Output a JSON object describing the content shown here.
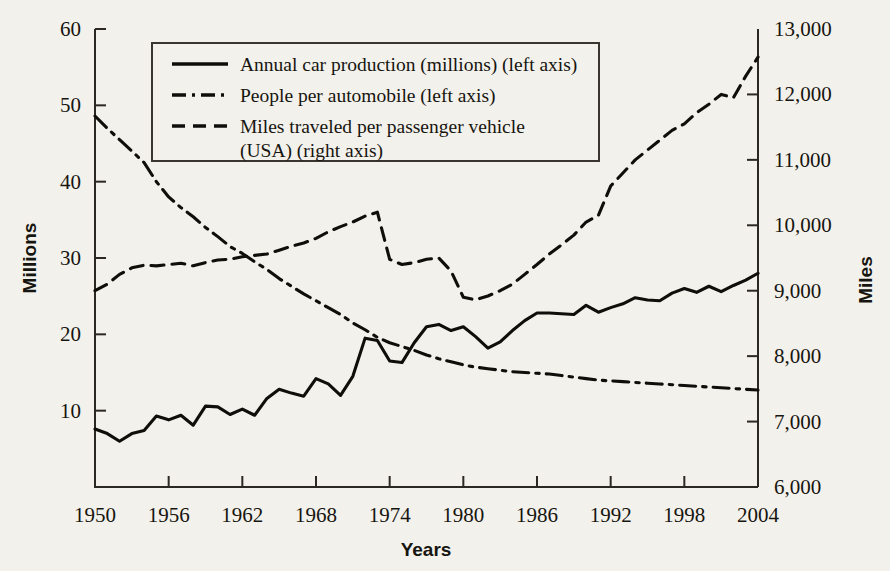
{
  "chart_data": {
    "type": "line",
    "title": "",
    "xlabel": "Years",
    "ylabel": "Millions",
    "y2label": "Miles",
    "grid": false,
    "legend_position": "top-left-inside",
    "xlim": [
      1950,
      2004
    ],
    "ylim": [
      0,
      60
    ],
    "y2lim": [
      6000,
      13000
    ],
    "xticks": [
      1950,
      1956,
      1962,
      1968,
      1974,
      1980,
      1986,
      1992,
      1998,
      2004
    ],
    "xticklabels": [
      "1950",
      "1956",
      "1962",
      "1968",
      "1974",
      "1980",
      "1986",
      "1992",
      "1998",
      "2004"
    ],
    "yticks": [
      10,
      20,
      30,
      40,
      50,
      60
    ],
    "yticklabels": [
      "10",
      "20",
      "30",
      "40",
      "50",
      "60"
    ],
    "y2ticks": [
      6000,
      7000,
      8000,
      9000,
      10000,
      11000,
      12000,
      13000
    ],
    "y2ticklabels": [
      "6,000",
      "7,000",
      "8,000",
      "9,000",
      "10,000",
      "11,000",
      "12,000",
      "13,000"
    ],
    "x": [
      1950,
      1951,
      1952,
      1953,
      1954,
      1955,
      1956,
      1957,
      1958,
      1959,
      1960,
      1961,
      1962,
      1963,
      1964,
      1965,
      1966,
      1967,
      1968,
      1969,
      1970,
      1971,
      1972,
      1973,
      1974,
      1975,
      1976,
      1977,
      1978,
      1979,
      1980,
      1981,
      1982,
      1983,
      1984,
      1985,
      1986,
      1987,
      1988,
      1989,
      1990,
      1991,
      1992,
      1993,
      1994,
      1995,
      1996,
      1997,
      1998,
      1999,
      2000,
      2001,
      2002,
      2003,
      2004
    ],
    "series": [
      {
        "name": "Annual car production (millions) (left axis)",
        "axis": "left",
        "style": "solid",
        "units": "millions",
        "values": [
          7.6,
          7.0,
          6.0,
          7.0,
          7.4,
          9.3,
          8.8,
          9.4,
          8.1,
          10.6,
          10.5,
          9.5,
          10.2,
          9.4,
          11.6,
          12.8,
          12.3,
          11.9,
          14.2,
          13.5,
          12.0,
          14.5,
          19.5,
          19.2,
          16.5,
          16.3,
          18.9,
          21.0,
          21.3,
          20.5,
          21.0,
          19.7,
          18.2,
          19.0,
          20.5,
          21.8,
          22.8,
          22.8,
          22.7,
          22.6,
          23.8,
          22.9,
          23.5,
          24.0,
          24.8,
          24.5,
          24.4,
          25.4,
          26.0,
          25.5,
          26.3,
          25.6,
          26.4,
          27.1,
          28.0
        ]
      },
      {
        "name": "People per automobile (left axis)",
        "axis": "left",
        "style": "dash-dot",
        "units": "people",
        "values": [
          48.6,
          47.0,
          45.5,
          44.0,
          42.5,
          40.0,
          38.0,
          36.6,
          35.4,
          34.0,
          32.8,
          31.5,
          30.6,
          29.5,
          28.5,
          27.3,
          26.3,
          25.3,
          24.4,
          23.5,
          22.6,
          21.5,
          20.6,
          19.6,
          18.9,
          18.4,
          17.9,
          17.3,
          16.8,
          16.4,
          16.0,
          15.7,
          15.5,
          15.3,
          15.1,
          15.0,
          14.9,
          14.8,
          14.6,
          14.4,
          14.2,
          14.0,
          13.9,
          13.8,
          13.7,
          13.6,
          13.5,
          13.4,
          13.3,
          13.2,
          13.1,
          13.0,
          12.9,
          12.8,
          12.7
        ]
      },
      {
        "name": "Miles traveled per passenger vehicle (USA) (right axis)",
        "axis": "right",
        "style": "dashed",
        "units": "miles",
        "values": [
          9000,
          9100,
          9250,
          9350,
          9390,
          9380,
          9400,
          9420,
          9380,
          9430,
          9470,
          9480,
          9520,
          9540,
          9560,
          9620,
          9680,
          9730,
          9800,
          9900,
          9980,
          10050,
          10140,
          10200,
          9480,
          9400,
          9430,
          9480,
          9500,
          9300,
          8900,
          8860,
          8920,
          9000,
          9100,
          9250,
          9400,
          9560,
          9700,
          9850,
          10050,
          10150,
          10600,
          10800,
          11000,
          11150,
          11300,
          11450,
          11550,
          11720,
          11850,
          12000,
          11950,
          12280,
          12570
        ]
      }
    ],
    "legend": [
      {
        "label": "Annual car production (millions) (left axis)",
        "style": "solid"
      },
      {
        "label": "People per automobile (left axis)",
        "style": "dash-dot"
      },
      {
        "label": "Miles traveled per passenger vehicle",
        "label_line2": "(USA) (right axis)",
        "style": "dashed"
      }
    ],
    "colors": {
      "ink": "#100e0a",
      "axis": "#2b2823",
      "background": "#f3f1ec"
    }
  }
}
